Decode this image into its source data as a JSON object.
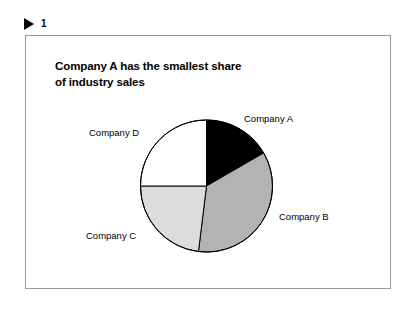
{
  "header": {
    "marker_icon": "triangle-right-icon",
    "number": "1"
  },
  "exhibit": {
    "title_line1": "Company A has the smallest share",
    "title_line2": "of industry sales"
  },
  "chart_data": {
    "type": "pie",
    "title": "Company A has the smallest share of industry sales",
    "legend_position": "callout-labels",
    "labels": [
      "Company A",
      "Company B",
      "Company C",
      "Company D"
    ],
    "values": [
      17,
      35,
      23,
      25
    ],
    "start_angle_deg": 0,
    "boundary_angles_deg": [
      0,
      60,
      187,
      270,
      360
    ],
    "colors": [
      "#000000",
      "#b3b3b3",
      "#dcdcdc",
      "#ffffff"
    ],
    "stroke": "#000000",
    "xlabel": "",
    "ylabel": "",
    "grid": false
  },
  "colors": {
    "frame_border": "#9a9a9a",
    "slice_a": "#000000",
    "slice_b": "#b3b3b3",
    "slice_c": "#dcdcdc",
    "slice_d": "#ffffff",
    "text": "#000000"
  }
}
